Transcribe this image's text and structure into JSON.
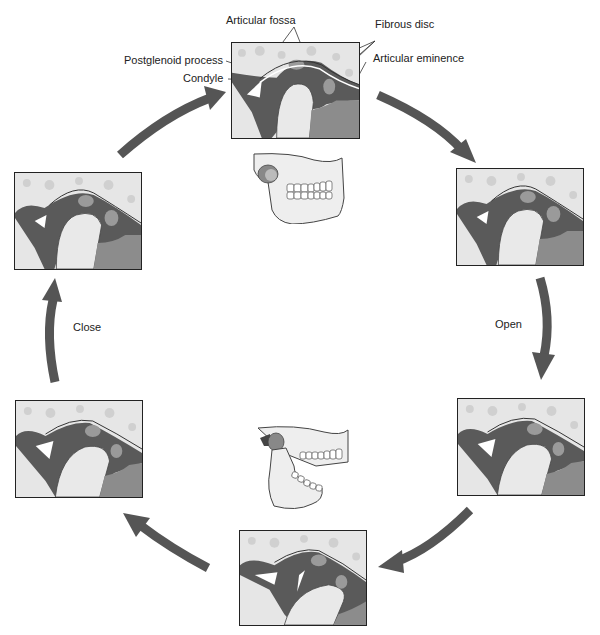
{
  "figure": {
    "type": "tmj-motion-cycle",
    "labels": {
      "articular_fossa": "Articular fossa",
      "fibrous_disc": "Fibrous disc",
      "postglenoid_process": "Postglenoid process",
      "condyle": "Condyle",
      "articular_eminence": "Articular eminence"
    },
    "motions": {
      "open": "Open",
      "close": "Close"
    },
    "colors": {
      "arrow": "#555555",
      "bone_light": "#e8e8e8",
      "bone_pattern": "#d2d2d2",
      "disc": "#9a9a9a",
      "ligament_dark": "#5a5a5a",
      "muscle": "#8c8c8c",
      "border": "#222222"
    },
    "panels": [
      {
        "id": "top",
        "stage": "closed"
      },
      {
        "id": "right-top",
        "stage": "opening-early"
      },
      {
        "id": "right-bottom",
        "stage": "opening-mid"
      },
      {
        "id": "bottom",
        "stage": "fully-open"
      },
      {
        "id": "left-bottom",
        "stage": "closing-mid"
      },
      {
        "id": "left-top",
        "stage": "closing-late"
      }
    ],
    "skulls": [
      {
        "id": "skull-closed",
        "state": "closed"
      },
      {
        "id": "skull-open",
        "state": "open"
      }
    ]
  }
}
